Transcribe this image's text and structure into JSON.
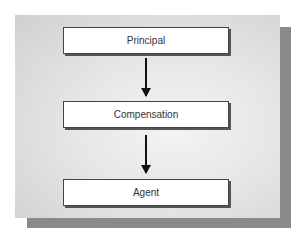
{
  "diagram": {
    "type": "flowchart",
    "direction": "top-to-bottom",
    "nodes": [
      {
        "id": "principal",
        "label": "Principal"
      },
      {
        "id": "compensation",
        "label": "Compensation"
      },
      {
        "id": "agent",
        "label": "Agent"
      }
    ],
    "edges": [
      {
        "from": "principal",
        "to": "compensation"
      },
      {
        "from": "compensation",
        "to": "agent"
      }
    ],
    "colors": {
      "panel": "#e0e0e0",
      "shadow": "#8a8a8a",
      "box": "#ffffff",
      "arrow": "#111111"
    }
  }
}
